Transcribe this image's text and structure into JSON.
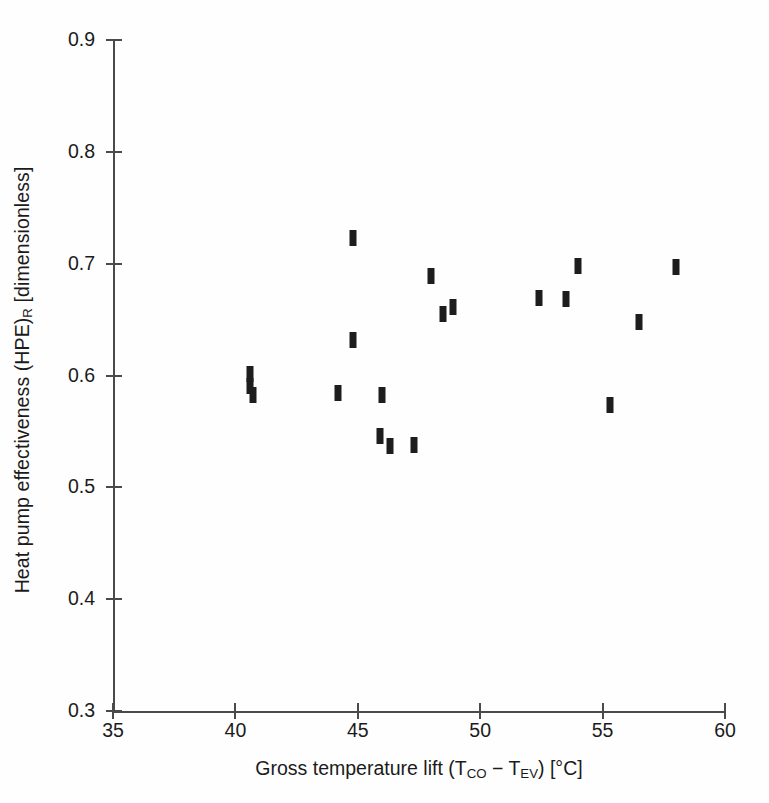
{
  "chart_data": {
    "type": "scatter",
    "title": "",
    "xlabel": "Gross temperature lift (T_CO − T_EV) [°C]",
    "ylabel": "Heat pump effectiveness (HPE)_R [dimensionless]",
    "xlim": [
      35,
      60
    ],
    "ylim": [
      0.3,
      0.9
    ],
    "xticks": [
      35,
      40,
      45,
      50,
      55,
      60
    ],
    "yticks": [
      0.3,
      0.4,
      0.5,
      0.6,
      0.7,
      0.8,
      0.9
    ],
    "xtick_labels": [
      "35",
      "40",
      "45",
      "50",
      "55",
      "60"
    ],
    "ytick_labels": [
      "0.3",
      "0.4",
      "0.5",
      "0.6",
      "0.7",
      "0.8",
      "0.9"
    ],
    "grid": false,
    "legend": null,
    "marker_style": "filled vertical bar (thick tick)",
    "marker_color": "#1d1d1d",
    "points": [
      {
        "x": 40.6,
        "y": 0.601
      },
      {
        "x": 40.6,
        "y": 0.591
      },
      {
        "x": 40.7,
        "y": 0.583
      },
      {
        "x": 44.2,
        "y": 0.584
      },
      {
        "x": 44.8,
        "y": 0.723
      },
      {
        "x": 44.8,
        "y": 0.632
      },
      {
        "x": 45.9,
        "y": 0.546
      },
      {
        "x": 46.0,
        "y": 0.583
      },
      {
        "x": 46.3,
        "y": 0.537
      },
      {
        "x": 47.3,
        "y": 0.538
      },
      {
        "x": 48.0,
        "y": 0.689
      },
      {
        "x": 48.5,
        "y": 0.655
      },
      {
        "x": 48.9,
        "y": 0.661
      },
      {
        "x": 52.4,
        "y": 0.669
      },
      {
        "x": 53.5,
        "y": 0.668
      },
      {
        "x": 54.0,
        "y": 0.698
      },
      {
        "x": 55.3,
        "y": 0.574
      },
      {
        "x": 56.5,
        "y": 0.648
      },
      {
        "x": 58.0,
        "y": 0.697
      }
    ]
  },
  "axes": {
    "xlabel_parts": {
      "lead": "Gross temperature lift (T",
      "sub1": "CO",
      "mid": " − T",
      "sub2": "EV",
      "tail": ") [°C]"
    },
    "ylabel_parts": {
      "lead": "Heat pump effectiveness (HPE)",
      "sub1": "R",
      "tail": " [dimensionless]"
    }
  }
}
